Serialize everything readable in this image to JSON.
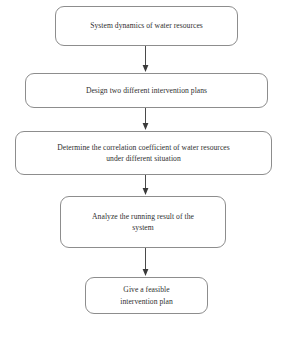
{
  "diagram": {
    "background_color": "#ffffff",
    "node_border_color": "#8d8d8d",
    "text_color": "#2f2f2f",
    "connector_color": "#4a4a4a",
    "orientation": "top-to-bottom",
    "nodes": [
      {
        "id": "node-1",
        "label": "System dynamics of water resources",
        "shape": "rounded-rectangle",
        "order": 1
      },
      {
        "id": "node-2",
        "label": "Design two different intervention plans",
        "shape": "rounded-rectangle",
        "order": 2
      },
      {
        "id": "node-3",
        "label": "Determine the correlation coefficient of water resources\nunder different situation",
        "shape": "rounded-rectangle",
        "order": 3
      },
      {
        "id": "node-4",
        "label": "Analyze the running result of the\nsystem",
        "shape": "rounded-rectangle",
        "order": 4
      },
      {
        "id": "node-5",
        "label": "Give a feasible\nintervention plan",
        "shape": "rounded-rectangle",
        "order": 5
      }
    ],
    "connectors": [
      {
        "id": "connector-1",
        "from": "node-1",
        "to": "node-2",
        "style": "solid-arrow-down"
      },
      {
        "id": "connector-2",
        "from": "node-2",
        "to": "node-3",
        "style": "solid-arrow-down"
      },
      {
        "id": "connector-3",
        "from": "node-3",
        "to": "node-4",
        "style": "solid-arrow-down"
      },
      {
        "id": "connector-4",
        "from": "node-4",
        "to": "node-5",
        "style": "solid-arrow-down"
      }
    ]
  }
}
